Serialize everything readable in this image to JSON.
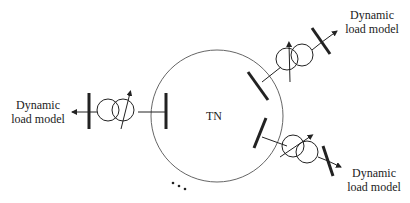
{
  "network": {
    "label": "TN"
  },
  "loads": [
    {
      "id": "left",
      "line1": "Dynamic",
      "line2": "load model"
    },
    {
      "id": "upper-right",
      "line1": "Dynamic",
      "line2": "load model"
    },
    {
      "id": "lower-right",
      "line1": "Dynamic",
      "line2": "load model"
    }
  ],
  "ellipsis": "...",
  "colors": {
    "stroke": "#222222",
    "circle": "#666666"
  }
}
